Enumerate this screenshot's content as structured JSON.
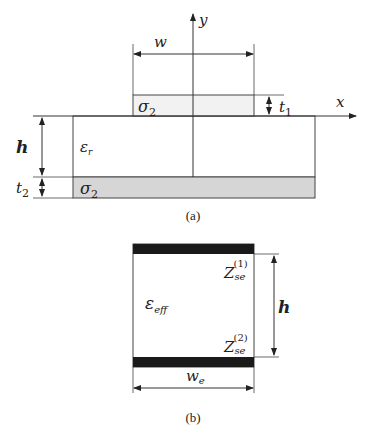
{
  "figure_a": {
    "caption": "(a)",
    "axes": {
      "x_label": "x",
      "y_label": "y"
    },
    "top_strip": {
      "label_sym": "σ",
      "label_sub": "2"
    },
    "substrate": {
      "label_sym": "ε",
      "label_sub": "r"
    },
    "ground": {
      "label_sym": "σ",
      "label_sub": "2"
    },
    "dims": {
      "width": "w",
      "strip_thickness_sym": "t",
      "strip_thickness_sub": "1",
      "height": "h",
      "ground_thickness_sym": "t",
      "ground_thickness_sub": "2"
    },
    "colors": {
      "ground_fill": "#d6d6d6",
      "strip_fill": "#f2f2f2"
    }
  },
  "figure_b": {
    "caption": "(b)",
    "medium": {
      "label_sym": "ε",
      "label_sub": "eff"
    },
    "top_surface": {
      "label_sym": "Z",
      "label_sub": "se",
      "label_sup": "(1)"
    },
    "bottom_surface": {
      "label_sym": "Z",
      "label_sub": "se",
      "label_sup": "(2)"
    },
    "dims": {
      "height": "h",
      "width_sym": "w",
      "width_sub": "e"
    },
    "colors": {
      "plate_fill": "#1a1a1a"
    }
  }
}
